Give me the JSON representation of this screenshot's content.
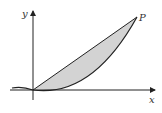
{
  "figure": {
    "labels": {
      "y_axis": "y",
      "x_axis": "x",
      "point": "P"
    },
    "colors": {
      "stroke": "#222222",
      "fill": "#d3d3d3",
      "background": "#ffffff"
    }
  }
}
